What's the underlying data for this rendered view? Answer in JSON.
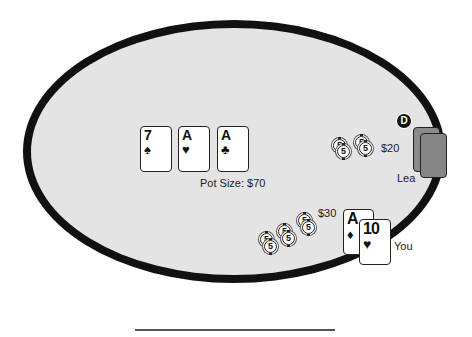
{
  "table": {
    "felt_color": "#e4e4e4",
    "rail_color": "#111111"
  },
  "board": {
    "cards": [
      {
        "rank": "7",
        "suit": "♠",
        "suit_name": "spades"
      },
      {
        "rank": "A",
        "suit": "♥",
        "suit_name": "hearts"
      },
      {
        "rank": "A",
        "suit": "♣",
        "suit_name": "clubs"
      }
    ],
    "pot_label": "Pot Size: $70"
  },
  "opponent": {
    "name": "Lea",
    "bet_label": "$20",
    "chip_values": [
      "5",
      "5",
      "5",
      "5"
    ],
    "is_dealer": true,
    "dealer_button_label": "D",
    "card_back_colors": [
      "#8a8a8a",
      "#858585"
    ]
  },
  "hero": {
    "name": "You",
    "bet_label": "$30",
    "chip_values": [
      "5",
      "5",
      "5",
      "5",
      "5",
      "5"
    ],
    "cards": [
      {
        "rank": "A",
        "suit": "♦",
        "suit_name": "diamonds"
      },
      {
        "rank": "10",
        "suit": "♥",
        "suit_name": "hearts"
      }
    ]
  }
}
